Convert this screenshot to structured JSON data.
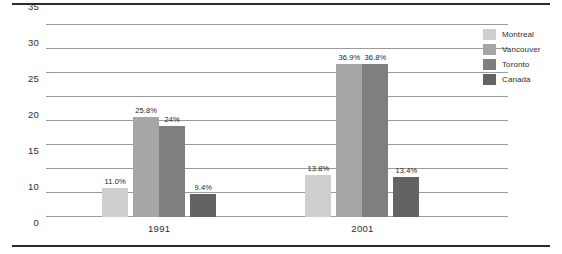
{
  "chart_data": {
    "type": "bar",
    "title": "",
    "subtitle": "",
    "xlabel": "",
    "ylabel": "",
    "categories": [
      "1991",
      "2001"
    ],
    "series": [
      {
        "name": "Montreal",
        "color": "#cfcfcf",
        "values": [
          11.0,
          13.8
        ],
        "labels": [
          "11.0%",
          "13.8%"
        ]
      },
      {
        "name": "Vancouver",
        "color": "#a6a6a6",
        "values": [
          25.8,
          36.9
        ],
        "labels": [
          "25.8%",
          "36.9%"
        ]
      },
      {
        "name": "Toronto",
        "color": "#7f7f7f",
        "values": [
          24.0,
          36.8
        ],
        "labels": [
          "24%",
          "36.8%"
        ]
      },
      {
        "name": "Canada",
        "color": "#636363",
        "values": [
          9.4,
          13.4
        ],
        "labels": [
          "9.4%",
          "13.4%"
        ]
      }
    ],
    "yticks": [
      0,
      10,
      15,
      20,
      25,
      30,
      35,
      40,
      45
    ],
    "ytick_labels": [
      "0",
      "10",
      "15",
      "20",
      "25",
      "30",
      "35",
      "40",
      "45"
    ],
    "ylim": [
      0,
      45
    ],
    "grid": true,
    "legend_position": "right",
    "gridline_color": "#9b9b9b",
    "rule_color": "#2b2b2b",
    "background": "#ffffff"
  },
  "legend": {
    "items": [
      {
        "label": "Montreal",
        "color": "#cfcfcf"
      },
      {
        "label": "Vancouver",
        "color": "#a6a6a6"
      },
      {
        "label": "Toronto",
        "color": "#7f7f7f"
      },
      {
        "label": "Canada",
        "color": "#636363"
      }
    ]
  }
}
